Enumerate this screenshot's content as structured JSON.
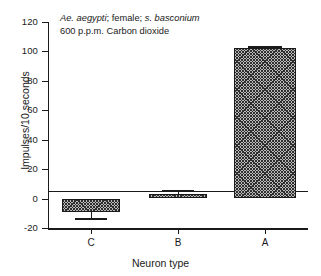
{
  "chart_data": {
    "type": "bar",
    "title": "",
    "annotation_lines": [
      {
        "parts": [
          {
            "text": "Ae. aegypti",
            "italic": true
          },
          {
            "text": ";  female; ",
            "italic": false
          },
          {
            "text": "s. basconium",
            "italic": true
          }
        ]
      },
      {
        "parts": [
          {
            "text": "600 p.p.m. Carbon dioxide",
            "italic": false
          }
        ]
      }
    ],
    "xlabel": "Neuron type",
    "ylabel": "Impulses/10 seconds",
    "categories": [
      "C",
      "B",
      "A"
    ],
    "values": [
      -9,
      3,
      102
    ],
    "errors": [
      4,
      3,
      1.5
    ],
    "ylim": [
      -20,
      120
    ],
    "yticks": [
      120,
      100,
      80,
      60,
      40,
      20,
      0,
      -20
    ],
    "ytick_labels": [
      "120",
      "100",
      "80",
      "60",
      "40",
      "20",
      "0",
      "-20"
    ],
    "grid": false,
    "legend": "none",
    "bar_fill": "#b9b9b9",
    "bar_edge": "#1a1a1a"
  }
}
